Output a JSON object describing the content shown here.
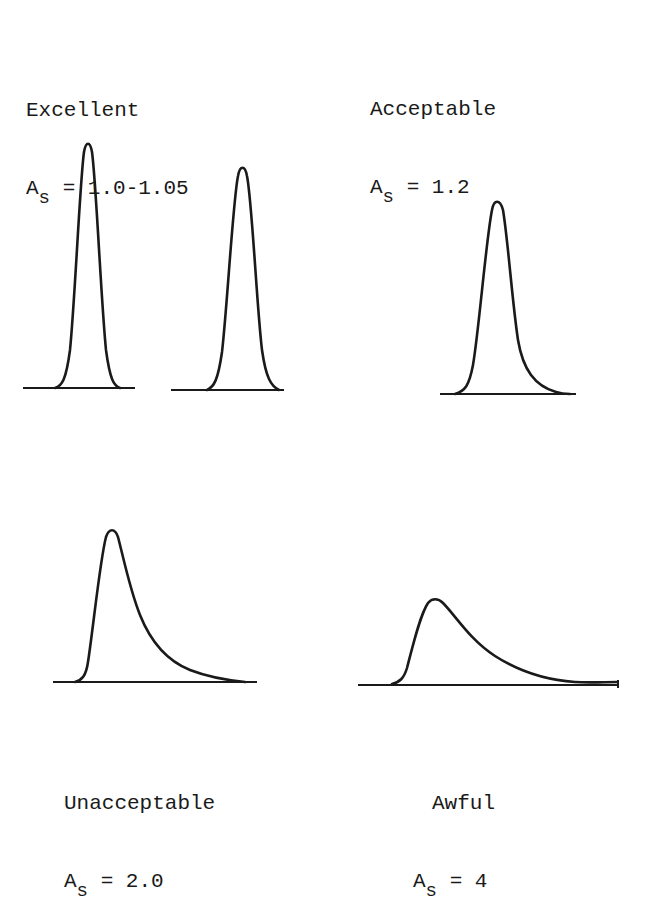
{
  "groups": [
    {
      "id": "excellent",
      "category": "Excellent",
      "symbol": "A",
      "subscript": "s",
      "value": "= 1.0-1.05"
    },
    {
      "id": "acceptable",
      "category": "Acceptable",
      "symbol": "A",
      "subscript": "s",
      "value": "= 1.2"
    },
    {
      "id": "unacceptable",
      "category": "Unacceptable",
      "symbol": "A",
      "subscript": "s",
      "value": "= 2.0"
    },
    {
      "id": "awful",
      "category": "Awful",
      "symbol": "A",
      "subscript": "s",
      "value": "= 4"
    }
  ],
  "peaks": [
    {
      "group": "excellent",
      "asymmetry": "1.0",
      "description": "symmetric narrow peak"
    },
    {
      "group": "excellent",
      "asymmetry": "1.05",
      "description": "near-symmetric narrow peak"
    },
    {
      "group": "acceptable",
      "asymmetry": "1.2",
      "description": "slightly tailing peak"
    },
    {
      "group": "unacceptable",
      "asymmetry": "2.0",
      "description": "strongly tailing peak"
    },
    {
      "group": "awful",
      "asymmetry": "4",
      "description": "very broad tailing peak"
    }
  ],
  "colors": {
    "ink": "#1a1a1a",
    "background": "#ffffff"
  }
}
